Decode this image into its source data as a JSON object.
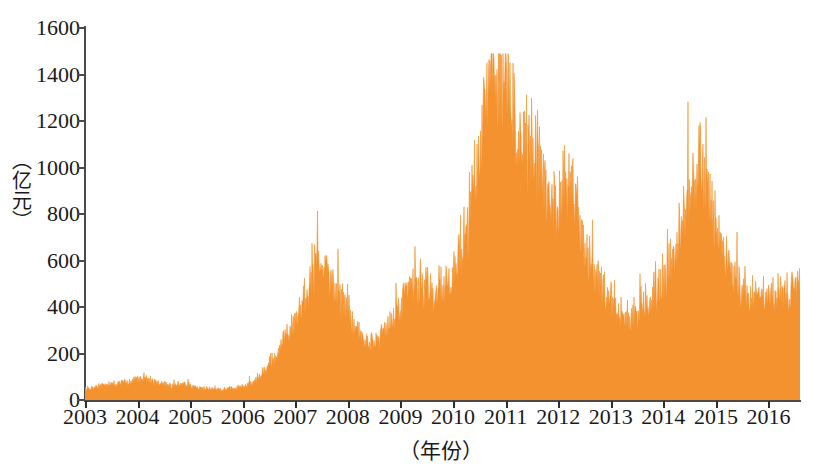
{
  "axes": {
    "y": {
      "label": "（亿元）",
      "ticks": [
        0,
        200,
        400,
        600,
        800,
        1000,
        1200,
        1400,
        1600
      ],
      "tick_labels": [
        "0",
        "200",
        "400",
        "600",
        "800",
        "1000",
        "1200",
        "1400",
        "1600"
      ],
      "min": 0,
      "max": 1600
    },
    "x": {
      "label": "（年份）",
      "ticks": [
        2003,
        2004,
        2005,
        2006,
        2007,
        2008,
        2009,
        2010,
        2011,
        2012,
        2013,
        2014,
        2015,
        2016
      ],
      "tick_labels": [
        "2003",
        "2004",
        "2005",
        "2006",
        "2007",
        "2008",
        "2009",
        "2010",
        "2011",
        "2012",
        "2013",
        "2014",
        "2015",
        "2016"
      ],
      "min": 2003,
      "max": 2016.6
    }
  },
  "colors": {
    "series_fill": "#F3922E",
    "axis": "#4a4a4a",
    "text": "#1a1a1a",
    "background": "#ffffff"
  },
  "chart_data": {
    "type": "area",
    "title": "",
    "subtitle": "",
    "xlabel": "（年份）",
    "ylabel": "（亿元）",
    "xlim": [
      2003,
      2016.6
    ],
    "ylim": [
      0,
      1600
    ],
    "grid": false,
    "legend": null,
    "series": [
      {
        "name": "成交额",
        "unit": "亿元",
        "color": "#F3922E",
        "x": [
          2003.0,
          2003.08,
          2003.17,
          2003.25,
          2003.33,
          2003.42,
          2003.5,
          2003.58,
          2003.67,
          2003.75,
          2003.83,
          2003.92,
          2004.0,
          2004.08,
          2004.17,
          2004.25,
          2004.33,
          2004.42,
          2004.5,
          2004.58,
          2004.67,
          2004.75,
          2004.83,
          2004.92,
          2005.0,
          2005.08,
          2005.17,
          2005.25,
          2005.33,
          2005.42,
          2005.5,
          2005.58,
          2005.67,
          2005.75,
          2005.83,
          2005.92,
          2006.0,
          2006.08,
          2006.17,
          2006.25,
          2006.33,
          2006.42,
          2006.5,
          2006.58,
          2006.67,
          2006.75,
          2006.83,
          2006.92,
          2007.0,
          2007.08,
          2007.17,
          2007.25,
          2007.33,
          2007.42,
          2007.5,
          2007.58,
          2007.67,
          2007.75,
          2007.83,
          2007.92,
          2008.0,
          2008.08,
          2008.17,
          2008.25,
          2008.33,
          2008.42,
          2008.5,
          2008.58,
          2008.67,
          2008.75,
          2008.83,
          2008.92,
          2009.0,
          2009.08,
          2009.17,
          2009.25,
          2009.33,
          2009.42,
          2009.5,
          2009.58,
          2009.67,
          2009.75,
          2009.83,
          2009.92,
          2010.0,
          2010.08,
          2010.17,
          2010.25,
          2010.33,
          2010.42,
          2010.5,
          2010.58,
          2010.67,
          2010.75,
          2010.83,
          2010.92,
          2011.0,
          2011.08,
          2011.17,
          2011.25,
          2011.33,
          2011.42,
          2011.5,
          2011.58,
          2011.67,
          2011.75,
          2011.83,
          2011.92,
          2012.0,
          2012.08,
          2012.17,
          2012.25,
          2012.33,
          2012.42,
          2012.5,
          2012.58,
          2012.67,
          2012.75,
          2012.83,
          2012.92,
          2013.0,
          2013.08,
          2013.17,
          2013.25,
          2013.33,
          2013.42,
          2013.5,
          2013.58,
          2013.67,
          2013.75,
          2013.83,
          2013.92,
          2014.0,
          2014.08,
          2014.17,
          2014.25,
          2014.33,
          2014.42,
          2014.5,
          2014.58,
          2014.67,
          2014.75,
          2014.83,
          2014.92,
          2015.0,
          2015.08,
          2015.17,
          2015.25,
          2015.33,
          2015.42,
          2015.5,
          2015.58,
          2015.67,
          2015.75,
          2015.83,
          2015.92,
          2016.0,
          2016.08,
          2016.17,
          2016.25,
          2016.33,
          2016.42,
          2016.5,
          2016.6
        ],
        "values": [
          45,
          52,
          48,
          58,
          62,
          70,
          66,
          60,
          72,
          78,
          74,
          80,
          88,
          95,
          90,
          84,
          78,
          70,
          66,
          62,
          60,
          58,
          62,
          66,
          60,
          56,
          52,
          50,
          48,
          46,
          44,
          42,
          46,
          50,
          48,
          52,
          56,
          62,
          70,
          86,
          105,
          130,
          150,
          175,
          200,
          235,
          270,
          300,
          330,
          370,
          420,
          480,
          520,
          560,
          595,
          545,
          500,
          470,
          440,
          400,
          370,
          330,
          300,
          275,
          255,
          240,
          230,
          255,
          285,
          320,
          345,
          370,
          400,
          430,
          455,
          470,
          480,
          465,
          450,
          440,
          430,
          455,
          470,
          490,
          520,
          560,
          620,
          700,
          800,
          900,
          1020,
          1150,
          1280,
          1400,
          1452,
          1380,
          1330,
          1250,
          1180,
          1125,
          1060,
          1020,
          1090,
          1040,
          960,
          900,
          860,
          820,
          790,
          850,
          925,
          880,
          800,
          720,
          650,
          600,
          560,
          520,
          480,
          450,
          420,
          400,
          380,
          360,
          350,
          345,
          360,
          380,
          400,
          420,
          440,
          470,
          500,
          540,
          580,
          620,
          680,
          760,
          860,
          960,
          1040,
          980,
          880,
          800,
          720,
          660,
          600,
          560,
          520,
          490,
          470,
          450,
          440,
          430,
          425,
          430,
          440,
          445,
          450,
          455,
          460,
          465,
          470,
          478
        ]
      }
    ],
    "annotations": [
      {
        "label": "峰值",
        "x": 2010.83,
        "y": 1452
      },
      {
        "label": "次峰",
        "x": 2014.67,
        "y": 1040
      },
      {
        "label": "2007峰",
        "x": 2007.5,
        "y": 595
      }
    ]
  }
}
